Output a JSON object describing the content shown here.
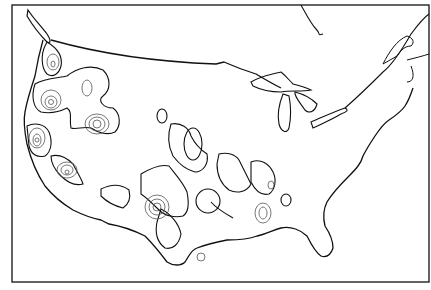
{
  "map": {
    "subject": "Contiguous United States with southern Canada outline",
    "style": "black-and-white line drawing",
    "colors": {
      "background": "#ffffff",
      "outline": "#111111",
      "contour": "#555555"
    },
    "layers": [
      {
        "name": "frame",
        "description": "rectangular map border"
      },
      {
        "name": "coastline-and-borders",
        "description": "US coastline, Canadian border, Great Lakes"
      },
      {
        "name": "hachured-regions",
        "description": "closed regions with tick hachures along boundary"
      },
      {
        "name": "concentric-contours",
        "description": "nested contour rings inside regions (isolines)"
      }
    ],
    "labels": []
  }
}
